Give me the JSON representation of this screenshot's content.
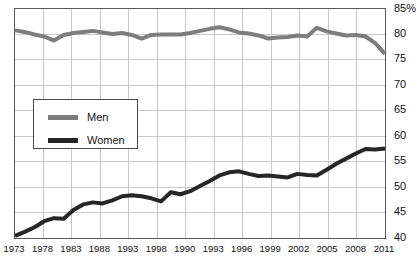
{
  "chart_data": {
    "type": "line",
    "title": "",
    "subtitle": "",
    "xlabel": "",
    "ylabel": "",
    "ylim": [
      40,
      85
    ],
    "xlim": [
      1973,
      2011
    ],
    "grid": true,
    "y_ticks": [
      "85%",
      "80",
      "75",
      "70",
      "65",
      "60",
      "55",
      "50",
      "45",
      "40"
    ],
    "y_tick_values": [
      85,
      80,
      75,
      70,
      65,
      60,
      55,
      50,
      45,
      40
    ],
    "y_unit_suffix": "%",
    "x_tick_labels": [
      "1973",
      "1978",
      "1983",
      "1988",
      "1993",
      "1998",
      "1990",
      "1993",
      "1996",
      "1999",
      "2002",
      "2005",
      "2008",
      "2011"
    ],
    "legend_position": "inside-left",
    "legend": [
      {
        "name": "Men",
        "color": "#7d7d7d"
      },
      {
        "name": "Women",
        "color": "#262626"
      }
    ],
    "x": [
      1973,
      1974,
      1975,
      1976,
      1977,
      1978,
      1979,
      1980,
      1981,
      1982,
      1983,
      1984,
      1985,
      1986,
      1987,
      1988,
      1989,
      1990,
      1991,
      1992,
      1993,
      1994,
      1995,
      1996,
      1997,
      1998,
      1999,
      2000,
      2001,
      2002,
      2003,
      2004,
      2005,
      2006,
      2007,
      2008,
      2009,
      2010,
      2011
    ],
    "series": [
      {
        "name": "Men",
        "color": "#7d7d7d",
        "values": [
          80.8,
          80.5,
          80.0,
          79.6,
          78.8,
          79.9,
          80.3,
          80.5,
          80.7,
          80.4,
          80.1,
          80.3,
          79.9,
          79.2,
          79.9,
          80.0,
          80.0,
          80.0,
          80.3,
          80.7,
          81.1,
          81.4,
          81.0,
          80.4,
          80.2,
          79.8,
          79.2,
          79.4,
          79.5,
          79.8,
          79.6,
          81.3,
          80.6,
          80.2,
          79.8,
          79.9,
          80.1,
          80.2,
          79.9
        ],
        "end_values_tail": [
          79.6,
          78.3,
          76.2
        ]
      },
      {
        "name": "Women",
        "color": "#262626",
        "values": [
          40.4,
          41.2,
          42.1,
          43.3,
          43.9,
          43.8,
          45.5,
          46.6,
          47.0,
          46.8,
          47.4,
          48.2,
          48.4,
          48.2,
          47.8,
          47.2,
          49.0,
          48.6,
          49.2,
          50.2,
          51.2,
          52.3,
          52.9,
          53.1,
          52.6,
          52.2,
          52.3,
          52.1,
          51.9,
          52.6,
          52.4,
          52.3,
          53.4,
          54.6,
          55.6,
          56.6,
          57.5,
          57.4,
          57.6
        ]
      }
    ],
    "annotations": []
  },
  "colors": {
    "men_line": "#7d7d7d",
    "women_line": "#262626",
    "grid": "#c8c8cc",
    "frame": "#58585a",
    "background": "#ffffff",
    "text": "#111111"
  }
}
